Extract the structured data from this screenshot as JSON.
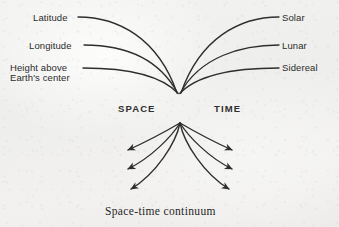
{
  "figure": {
    "title_caption": "Space-time continuum",
    "background_color": "#f1f1ef",
    "ink_color": "#2b2b2b",
    "node_label_space": "SPACE",
    "node_label_time": "TIME",
    "convergence_point": {
      "x": 179,
      "y": 95
    },
    "fan_apex": {
      "x": 180,
      "y": 122
    }
  },
  "left_inputs": [
    {
      "label": "Latitude",
      "x": 33,
      "y": 13,
      "line_start": {
        "x": 78,
        "y": 17
      }
    },
    {
      "label": "Longitude",
      "x": 29,
      "y": 41,
      "line_start": {
        "x": 84,
        "y": 45
      }
    },
    {
      "label": "Height above",
      "x": 10,
      "y": 64,
      "line_start": {
        "x": 83,
        "y": 68
      }
    },
    {
      "label": "Earth's center",
      "x": 10,
      "y": 74,
      "line_start": null
    }
  ],
  "right_inputs": [
    {
      "label": "Solar",
      "x": 282,
      "y": 13,
      "line_start": {
        "x": 279,
        "y": 17
      }
    },
    {
      "label": "Lunar",
      "x": 282,
      "y": 41,
      "line_start": {
        "x": 279,
        "y": 45
      }
    },
    {
      "label": "Sidereal",
      "x": 282,
      "y": 64,
      "line_start": {
        "x": 279,
        "y": 68
      }
    }
  ],
  "output_arrows": {
    "count": 6,
    "left_tips": [
      {
        "x": 124,
        "y": 151
      },
      {
        "x": 124,
        "y": 170
      },
      {
        "x": 127,
        "y": 190
      }
    ],
    "right_tips": [
      {
        "x": 236,
        "y": 151
      },
      {
        "x": 236,
        "y": 170
      },
      {
        "x": 233,
        "y": 190
      }
    ]
  }
}
